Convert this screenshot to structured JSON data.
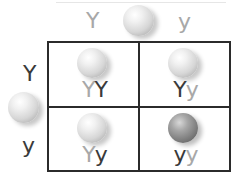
{
  "diagram": {
    "type": "punnett-square",
    "cross": "Yy x Yy",
    "colors": {
      "grid_line": "#2b2b2b",
      "dark_allele": "#3a3a3a",
      "light_allele": "#a8a8a8",
      "yellow_pea_shade": "#d6d6d6",
      "green_pea_shade": "#7c7c7c"
    },
    "top_parent": {
      "pea": "yellow-pea",
      "alleles": [
        "Y",
        "y"
      ]
    },
    "left_parent": {
      "pea": "yellow-pea",
      "alleles": [
        "Y",
        "y"
      ]
    },
    "cells": [
      {
        "row": 0,
        "col": 0,
        "first": "Y",
        "second": "Y",
        "genotype": "YY",
        "pea": "yellow-pea"
      },
      {
        "row": 0,
        "col": 1,
        "first": "Y",
        "second": "y",
        "genotype": "Yy",
        "pea": "yellow-pea"
      },
      {
        "row": 1,
        "col": 0,
        "first": "Y",
        "second": "y",
        "genotype": "Yy",
        "pea": "yellow-pea"
      },
      {
        "row": 1,
        "col": 1,
        "first": "y",
        "second": "y",
        "genotype": "yy",
        "pea": "green-pea"
      }
    ]
  }
}
